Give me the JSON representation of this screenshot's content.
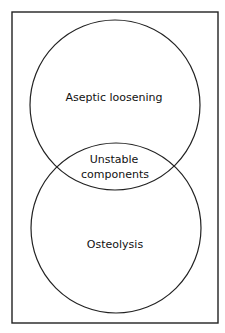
{
  "diagram": {
    "type": "venn",
    "sets": [
      {
        "id": "top",
        "label": "Aseptic loosening"
      },
      {
        "id": "bottom",
        "label": "Osteolysis"
      }
    ],
    "intersection": {
      "label_line1": "Unstable",
      "label_line2": "components"
    }
  }
}
